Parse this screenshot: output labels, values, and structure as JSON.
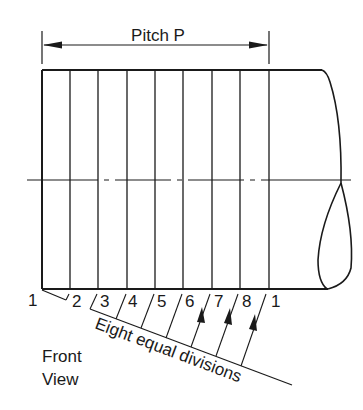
{
  "diagram": {
    "type": "engineering-drawing",
    "dimension": {
      "label": "Pitch P",
      "x_start": 42,
      "x_end": 269,
      "y": 45
    },
    "cylinder": {
      "left": 42,
      "top": 70,
      "bottom": 289,
      "right_top_corner": 322,
      "centerline_y": 180,
      "centerline_x_start": 27,
      "centerline_x_end": 351
    },
    "division_lines_x": [
      42,
      70,
      98,
      127,
      155,
      183,
      212,
      240,
      269
    ],
    "division_labels": [
      "1",
      "2",
      "3",
      "4",
      "5",
      "6",
      "7",
      "8",
      "1"
    ],
    "construction_line": {
      "label": "Eight equal divisions",
      "start": [
        42,
        290
      ],
      "end": [
        292,
        385
      ],
      "points": [
        [
          67,
          300
        ],
        [
          92,
          309
        ],
        [
          117,
          318
        ],
        [
          142,
          328
        ],
        [
          166,
          337
        ],
        [
          191,
          346
        ],
        [
          216,
          356
        ],
        [
          241,
          365
        ]
      ]
    },
    "arrows_count": 3,
    "view_label_line1": "Front",
    "view_label_line2": "View",
    "colors": {
      "ink": "#1a1a1a",
      "paper": "#ffffff"
    }
  }
}
